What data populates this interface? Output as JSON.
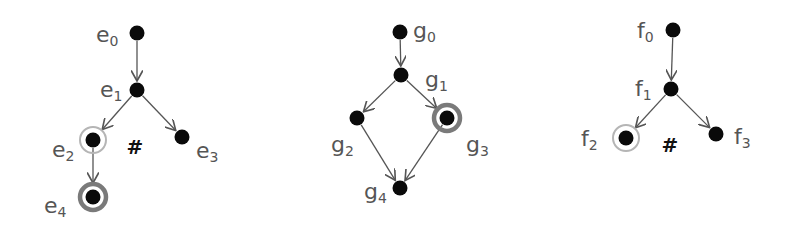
{
  "colors": {
    "node": "#0a0a0a",
    "edge": "#555555",
    "label": "#555555",
    "ring_light": "#b5b5b5",
    "ring_dark": "#7a7a7a",
    "hash": "#111111"
  },
  "graphs": [
    {
      "id": "e",
      "nodes": [
        {
          "id": "e0",
          "base": "e",
          "sub": "0",
          "x": 137,
          "y": 33,
          "lx": 96,
          "ly": 42,
          "ring": "none"
        },
        {
          "id": "e1",
          "base": "e",
          "sub": "1",
          "x": 137,
          "y": 90,
          "lx": 100,
          "ly": 97,
          "ring": "none"
        },
        {
          "id": "e2",
          "base": "e",
          "sub": "2",
          "x": 93,
          "y": 140,
          "lx": 52,
          "ly": 157,
          "ring": "light"
        },
        {
          "id": "e3",
          "base": "e",
          "sub": "3",
          "x": 182,
          "y": 137,
          "lx": 196,
          "ly": 158,
          "ring": "none"
        },
        {
          "id": "e4",
          "base": "e",
          "sub": "4",
          "x": 93,
          "y": 197,
          "lx": 44,
          "ly": 213,
          "ring": "dark"
        }
      ],
      "edges": [
        [
          "e0",
          "e1"
        ],
        [
          "e1",
          "e2"
        ],
        [
          "e1",
          "e3"
        ],
        [
          "e2",
          "e4"
        ]
      ],
      "hash": {
        "text": "#",
        "x": 135,
        "y": 154
      }
    },
    {
      "id": "g",
      "nodes": [
        {
          "id": "g0",
          "base": "g",
          "sub": "0",
          "x": 400,
          "y": 32,
          "lx": 413,
          "ly": 38,
          "ring": "none"
        },
        {
          "id": "g1",
          "base": "g",
          "sub": "1",
          "x": 401,
          "y": 75,
          "lx": 425,
          "ly": 87,
          "ring": "none"
        },
        {
          "id": "g2",
          "base": "g",
          "sub": "2",
          "x": 357,
          "y": 118,
          "lx": 331,
          "ly": 152,
          "ring": "none"
        },
        {
          "id": "g3",
          "base": "g",
          "sub": "3",
          "x": 447,
          "y": 118,
          "lx": 466,
          "ly": 152,
          "ring": "dark"
        },
        {
          "id": "g4",
          "base": "g",
          "sub": "4",
          "x": 400,
          "y": 188,
          "lx": 364,
          "ly": 199,
          "ring": "none"
        }
      ],
      "edges": [
        [
          "g0",
          "g1"
        ],
        [
          "g1",
          "g2"
        ],
        [
          "g1",
          "g3"
        ],
        [
          "g2",
          "g4"
        ],
        [
          "g3",
          "g4"
        ]
      ],
      "hash": null
    },
    {
      "id": "f",
      "nodes": [
        {
          "id": "f0",
          "base": "f",
          "sub": "0",
          "x": 673,
          "y": 30,
          "lx": 637,
          "ly": 38,
          "ring": "none"
        },
        {
          "id": "f1",
          "base": "f",
          "sub": "1",
          "x": 671,
          "y": 89,
          "lx": 635,
          "ly": 96,
          "ring": "none"
        },
        {
          "id": "f2",
          "base": "f",
          "sub": "2",
          "x": 626,
          "y": 138,
          "lx": 581,
          "ly": 146,
          "ring": "light"
        },
        {
          "id": "f3",
          "base": "f",
          "sub": "3",
          "x": 716,
          "y": 134,
          "lx": 734,
          "ly": 144,
          "ring": "none"
        }
      ],
      "edges": [
        [
          "f0",
          "f1"
        ],
        [
          "f1",
          "f2"
        ],
        [
          "f1",
          "f3"
        ]
      ],
      "hash": {
        "text": "#",
        "x": 670,
        "y": 152
      }
    }
  ]
}
